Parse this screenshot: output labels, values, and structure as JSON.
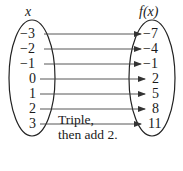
{
  "header": {
    "domain_label": "x",
    "range_label": "f(x)"
  },
  "domain_values": [
    "−3",
    "−2",
    "−1",
    "0",
    "1",
    "2",
    "3"
  ],
  "range_values": [
    "−7",
    "−4",
    "−1",
    "2",
    "5",
    "8",
    "11"
  ],
  "caption": {
    "line1": "Triple,",
    "line2": "then add 2."
  },
  "mapping": [
    {
      "x": -3,
      "fx": -7
    },
    {
      "x": -2,
      "fx": -4
    },
    {
      "x": -1,
      "fx": -1
    },
    {
      "x": 0,
      "fx": 2
    },
    {
      "x": 1,
      "fx": 5
    },
    {
      "x": 2,
      "fx": 8
    },
    {
      "x": 3,
      "fx": 11
    }
  ],
  "rule": "Triple, then add 2."
}
